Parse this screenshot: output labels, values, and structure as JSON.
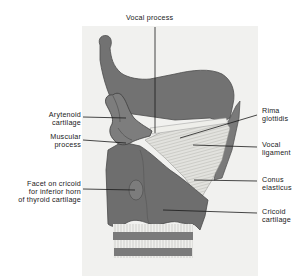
{
  "figure": {
    "colors": {
      "background": "#ffffff",
      "plate": "#f1f1ef",
      "cartilage": "#727272",
      "cartilage_dark": "#5a5a5a",
      "membrane": "#d8d8d4",
      "ligament": "#eeeeea",
      "leader_line": "#1a1a1a",
      "text": "#1a1a1a"
    },
    "labels": {
      "vocal_process": "Vocal process",
      "arytenoid_cartilage": "Arytenoid\ncartilage",
      "muscular_process": "Muscular\nprocess",
      "facet_on_cricoid": "Facet on cricoid\nfor inferior horn\nof thyroid cartilage",
      "rima_glottidis": "Rima\nglottidis",
      "vocal_ligament": "Vocal\nligament",
      "conus_elasticus": "Conus\nelasticus",
      "cricoid_cartilage": "Cricoid\ncartilage"
    }
  }
}
